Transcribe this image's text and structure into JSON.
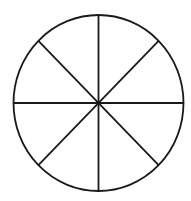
{
  "diagram": {
    "type": "divided-circle",
    "sectors": 8,
    "background": "#ffffff",
    "stroke_color": "#1a1a1a",
    "stroke_width": 1.8,
    "center": {
      "x": 98.5,
      "y": 103
    },
    "radius_x": 85,
    "radius_y": 88,
    "center_dot_radius": 2.2,
    "lines": [
      {
        "name": "vertical",
        "x1": 98.5,
        "y1": 15,
        "x2": 98.5,
        "y2": 191
      },
      {
        "name": "horizontal",
        "x1": 13.5,
        "y1": 103,
        "x2": 183.5,
        "y2": 103
      },
      {
        "name": "diagonal-tl-br",
        "x1": 38.4,
        "y1": 40.8,
        "x2": 158.6,
        "y2": 165.2
      },
      {
        "name": "diagonal-tr-bl",
        "x1": 158.6,
        "y1": 40.8,
        "x2": 38.4,
        "y2": 165.2
      }
    ]
  }
}
